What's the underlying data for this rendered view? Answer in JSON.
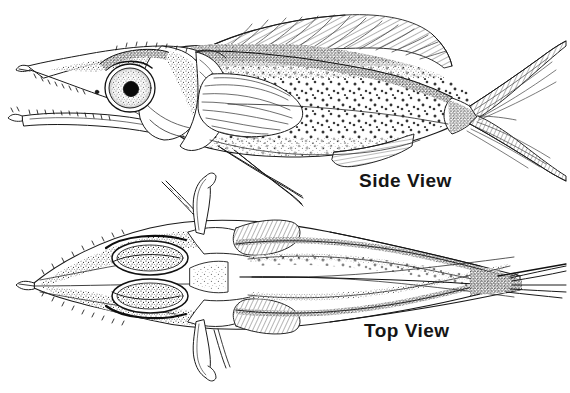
{
  "plate": {
    "title": "Fish anatomical plate",
    "background_color": "#ffffff",
    "ink_color": "#1a1a1a",
    "medium": "pen-and-ink stipple illustration",
    "subject": "elongate long-snouted spiny fish"
  },
  "labels": {
    "side_view": "Side View",
    "top_view": "Top View"
  },
  "figures": [
    {
      "id": "side-view-figure",
      "name": "fish-side-view",
      "orientation": "lateral, head to the left",
      "label": "Side View",
      "parts": [
        "elongated pointed snout",
        "toothed upper jaw",
        "toothed lower jaw",
        "large round eye with dark pupil",
        "stippled head plates",
        "opercle",
        "long dorsal fin with hatched rays",
        "pectoral fin with radiating rays",
        "two long trailing pelvic filaments",
        "anal fin with hatched rays",
        "stippled spotted flank",
        "deeply forked caudal fin"
      ]
    },
    {
      "id": "top-view-figure",
      "name": "fish-top-view",
      "orientation": "dorsal, head to the left",
      "label": "Top View",
      "parts": [
        "pointed rostrum with spiny margins",
        "paired oval eyes",
        "symmetric head shields",
        "paired pectoral fins",
        "paired trailing pelvic filaments",
        "longitudinal stippled body bands",
        "tapering caudal peduncle",
        "narrow caudal fin"
      ]
    }
  ]
}
